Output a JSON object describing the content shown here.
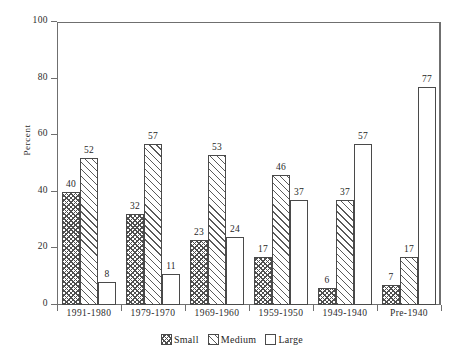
{
  "chart_data": {
    "type": "bar",
    "title": "",
    "xlabel": "",
    "ylabel": "Percent",
    "ylim": [
      0,
      100
    ],
    "yticks": [
      0,
      20,
      40,
      60,
      80,
      100
    ],
    "grid": false,
    "legend_position": "bottom",
    "categories": [
      "1991-1980",
      "1979-1970",
      "1969-1960",
      "1959-1950",
      "1949-1940",
      "Pre-1940"
    ],
    "series": [
      {
        "name": "Small",
        "values": [
          40,
          32,
          23,
          17,
          6,
          7
        ]
      },
      {
        "name": "Medium",
        "values": [
          52,
          57,
          53,
          46,
          37,
          17
        ]
      },
      {
        "name": "Large",
        "values": [
          8,
          11,
          24,
          37,
          57,
          77
        ]
      }
    ]
  },
  "axis": {
    "y_label": "Percent",
    "y_tick_labels": [
      "0",
      "20",
      "40",
      "60",
      "80",
      "100"
    ]
  },
  "legend": {
    "items": [
      {
        "label": "Small",
        "pattern": "checker-hatch"
      },
      {
        "label": "Medium",
        "pattern": "diagonal-hatch"
      },
      {
        "label": "Large",
        "pattern": "empty"
      }
    ]
  },
  "colors": {
    "axis": "#6f6f6f",
    "bar_outline": "#4a4a4a",
    "hatch": "#4f4f4f",
    "text": "#1f1f1f",
    "background": "#ffffff"
  }
}
